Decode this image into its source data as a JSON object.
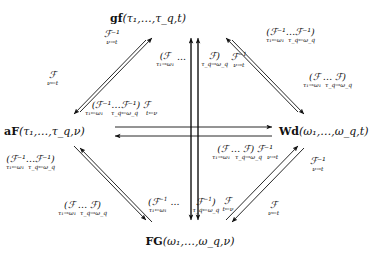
{
  "figure": {
    "type": "commutative-diagram"
  },
  "nodes": {
    "top": {
      "name": "gf",
      "args": "(τ₁,…,τ_q,t)",
      "label": "gf(τ₁,…,τ_q,t)"
    },
    "left": {
      "name": "aF",
      "args": "(τ₁,…,τ_q,ν)",
      "label": "aF(τ₁,…,τ_q,ν)"
    },
    "right": {
      "name": "Wd",
      "args": "(ω₁,…,ω_q,t)",
      "label": "Wd(ω₁,…,ω_q,t)"
    },
    "bottom": {
      "name": "FG",
      "args": "(ω₁,…,ω_q,ν)",
      "label": "FG(ω₁,…,ω_q,ν)"
    }
  },
  "labels": {
    "top_left_inner": {
      "op": "ℱ⁻¹",
      "subs": [
        "ν→t"
      ],
      "text": "ℱ⁻¹ ν→t"
    },
    "top_left_outer": {
      "op": "ℱ",
      "subs": [
        "ν←t"
      ],
      "text": "ℱ ν←t"
    },
    "top_right_inner": {
      "op": "(ℱ⁻¹…ℱ⁻¹)",
      "subs": [
        "τ₁←ω₁",
        "τ_q←ω_q"
      ],
      "text": "(ℱ⁻¹…ℱ⁻¹) τ₁←ω₁ τ_q←ω_q"
    },
    "top_right_outer": {
      "op": "(ℱ … ℱ)",
      "subs": [
        "τ₁→ω₁",
        "τ_q→ω_q"
      ],
      "text": "(ℱ … ℱ) τ₁→ω₁ τ_q→ω_q"
    },
    "center_upper": {
      "op": "(ℱ … ℱ) ℱ⁻¹",
      "subs": [
        "τ₁→ω₁",
        "τ_q→ω_q",
        "ν→t"
      ],
      "text": "(ℱ … ℱ) ℱ⁻¹ τ₁→ω₁ τ_q→ω_q ν→t"
    },
    "horiz_upper": {
      "op": "(ℱ⁻¹…ℱ⁻¹) ℱ",
      "subs": [
        "τ₁←ω₁",
        "τ_q←ω_q",
        "t←ν"
      ],
      "text": "(ℱ⁻¹…ℱ⁻¹) ℱ τ₁←ω₁ τ_q←ω_q t←ν"
    },
    "horiz_lower": {
      "op": "(ℱ … ℱ) ℱ⁻¹",
      "subs": [
        "τ₁→ω₁",
        "τ_q→ω_q",
        "ν→t"
      ],
      "text": "(ℱ … ℱ) ℱ⁻¹ τ₁→ω₁ τ_q→ω_q ν→t"
    },
    "bottom_left_inner": {
      "op": "(ℱ⁻¹…ℱ⁻¹)",
      "subs": [
        "τ₁←ω₁",
        "τ_q←ω_q"
      ],
      "text": "(ℱ⁻¹…ℱ⁻¹) τ₁←ω₁ τ_q←ω_q"
    },
    "bottom_left_outer": {
      "op": "(ℱ … ℱ)",
      "subs": [
        "τ₁→ω₁",
        "τ_q→ω_q"
      ],
      "text": "(ℱ … ℱ) τ₁→ω₁ τ_q→ω_q"
    },
    "center_lower": {
      "op": "(ℱ⁻¹ … ℱ⁻¹) ℱ",
      "subs": [
        "τ₁←ω₁",
        "τ_q←ω_q",
        "t←ν"
      ],
      "text": "(ℱ⁻¹ … ℱ⁻¹) ℱ τ₁←ω₁ τ_q←ω_q t←ν"
    },
    "bottom_right_inner": {
      "op": "ℱ⁻¹",
      "subs": [
        "ν→t"
      ],
      "text": "ℱ⁻¹ ν→t"
    },
    "bottom_right_outer": {
      "op": "ℱ",
      "subs": [
        "ν←t"
      ],
      "text": "ℱ ν←t"
    }
  },
  "colors": {
    "ink": "#111111",
    "background": "#ffffff"
  }
}
